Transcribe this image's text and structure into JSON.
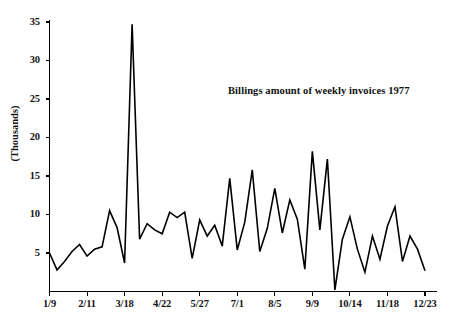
{
  "chart_data": {
    "type": "line",
    "title": "Billings amount of weekly invoices 1977",
    "xlabel": "",
    "ylabel": "(Thousands)",
    "ylim": [
      0,
      36
    ],
    "xlim": [
      0,
      52
    ],
    "grid": false,
    "legend": null,
    "y_ticks": [
      5,
      10,
      15,
      20,
      25,
      30,
      35
    ],
    "y_tick_labels": [
      "5",
      "10",
      "15",
      "20",
      "25",
      "30",
      "35"
    ],
    "x_tick_labels": [
      "1/9",
      "2/11",
      "3/18",
      "4/22",
      "5/27",
      "7/1",
      "8/5",
      "9/9",
      "10/14",
      "11/18",
      "12/23"
    ],
    "x_tick_indices": [
      0,
      5,
      10,
      15,
      20,
      25,
      30,
      35,
      40,
      45,
      50
    ],
    "series": [
      {
        "name": "Weekly billings",
        "x": [
          0,
          1,
          2,
          3,
          4,
          5,
          6,
          7,
          8,
          9,
          10,
          11,
          12,
          13,
          14,
          15,
          16,
          17,
          18,
          19,
          20,
          21,
          22,
          23,
          24,
          25,
          26,
          27,
          28,
          29,
          30,
          31,
          32,
          33,
          34,
          35,
          36,
          37,
          38,
          39,
          40,
          41,
          42,
          43,
          44,
          45,
          46,
          47,
          48,
          49,
          50
        ],
        "values": [
          5.0,
          2.8,
          3.9,
          5.2,
          6.1,
          4.6,
          5.5,
          5.8,
          10.5,
          8.3,
          3.7,
          34.7,
          6.8,
          8.8,
          8.0,
          7.5,
          10.3,
          9.6,
          10.3,
          4.3,
          9.3,
          7.2,
          8.6,
          5.9,
          14.7,
          5.4,
          9.0,
          15.8,
          5.2,
          8.2,
          13.4,
          7.6,
          11.9,
          9.4,
          2.9,
          18.2,
          8.0,
          17.2,
          0.2,
          6.8,
          9.7,
          5.5,
          2.5,
          7.2,
          4.2,
          8.5,
          11.0,
          3.9,
          7.2,
          5.5,
          2.7
        ]
      }
    ],
    "annotations": [
      {
        "text": "Billings amount of weekly invoices 1977",
        "x": 25,
        "y": 23.5
      }
    ],
    "style": {
      "line_color": "#000000",
      "background": "#ffffff",
      "axis_color": "#000000"
    }
  }
}
